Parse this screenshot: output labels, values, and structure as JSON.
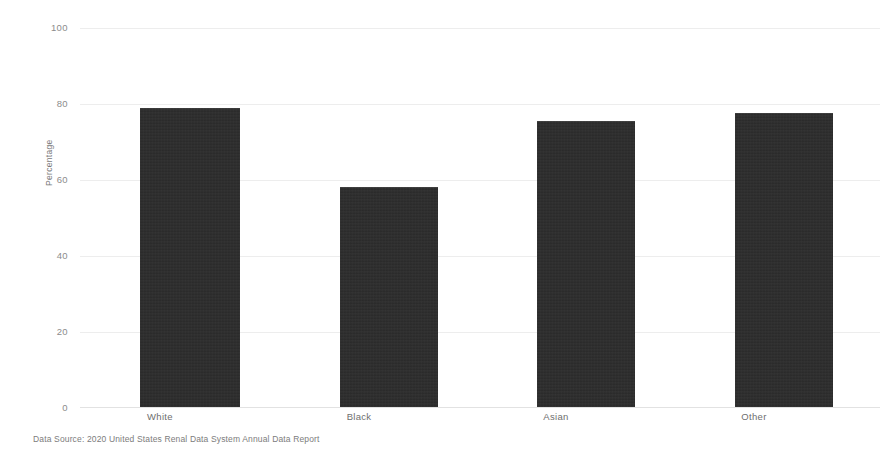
{
  "chart_data": {
    "type": "bar",
    "title": "",
    "subtitle": "",
    "categories": [
      "White",
      "Black",
      "Asian",
      "Other"
    ],
    "values": [
      79,
      58,
      75.5,
      77.5
    ],
    "series": [
      {
        "name": "Percentage",
        "values": [
          79,
          58,
          75.5,
          77.5
        ]
      }
    ],
    "xlabel": "",
    "ylabel": "Percentage",
    "ylim": [
      0,
      100
    ],
    "yticks": [
      0,
      20,
      40,
      60,
      80,
      100
    ],
    "ytick_labels": [
      "0",
      "20",
      "40",
      "60",
      "80",
      "100"
    ],
    "grid": true,
    "grid_axis": "y",
    "legend": false,
    "legend_position": "none",
    "bar_color": "#2b2b2b",
    "background_color": "#ffffff",
    "caption": "Data Source: 2020 United States Renal Data System Annual Data Report"
  },
  "axis": {
    "y_title": "Percentage"
  },
  "footer": {
    "data_source": "Data Source: 2020 United States Renal Data System Annual Data Report"
  }
}
